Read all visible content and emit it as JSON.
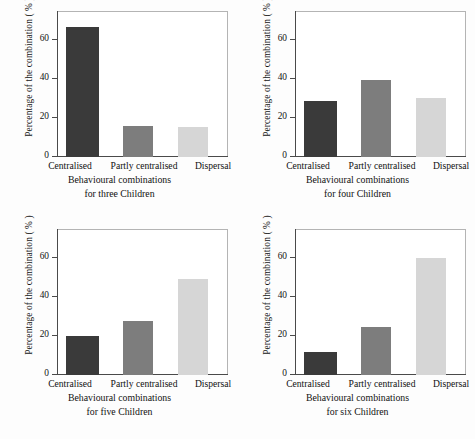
{
  "figure": {
    "background": "#ffffff"
  },
  "palette": {
    "centralised": "#3a3a3a",
    "partly_centralised": "#7d7d7d",
    "dispersal": "#d6d6d6",
    "axis": "#4a4a4a",
    "frame": "#9a9a9a",
    "text": "#111111"
  },
  "common": {
    "ylabel": "Percentage of the combination ( % )",
    "xlabel_line1": "Behavioural combinations",
    "categories": [
      "Centralised",
      "Partly centralised",
      "Dispersal"
    ],
    "yticks": [
      "0",
      "20",
      "40",
      "60"
    ],
    "ytick_values": [
      0,
      20,
      40,
      60
    ],
    "ylim": [
      0,
      75
    ]
  },
  "panels": [
    {
      "id": "panel-three-children",
      "position": "top-left",
      "xlabel_line2": "for three Children",
      "ticklabels": {
        "t0": "0",
        "t20": "20",
        "t40": "40",
        "t60": "60"
      },
      "cats": {
        "c0": "Centralised",
        "c1": "Partly centralised",
        "c2": "Dispersal"
      },
      "ylabel": "Percentage of the combination ( % )",
      "xlabel_line1": "Behavioural combinations"
    },
    {
      "id": "panel-four-children",
      "position": "top-right",
      "xlabel_line2": "for four Children",
      "ticklabels": {
        "t0": "0",
        "t20": "20",
        "t40": "40",
        "t60": "60"
      },
      "cats": {
        "c0": "Centralised",
        "c1": "Partly centralised",
        "c2": "Dispersal"
      },
      "ylabel": "Percentage of the combination ( % )",
      "xlabel_line1": "Behavioural combinations"
    },
    {
      "id": "panel-five-children",
      "position": "bottom-left",
      "xlabel_line2": "for five Children",
      "ticklabels": {
        "t0": "0",
        "t20": "20",
        "t40": "40",
        "t60": "60"
      },
      "cats": {
        "c0": "Centralised",
        "c1": "Partly centralised",
        "c2": "Dispersal"
      },
      "ylabel": "Percentage of the combination ( % )",
      "xlabel_line1": "Behavioural combinations"
    },
    {
      "id": "panel-six-children",
      "position": "bottom-right",
      "xlabel_line2": "for six Children",
      "ticklabels": {
        "t0": "0",
        "t20": "20",
        "t40": "40",
        "t60": "60"
      },
      "cats": {
        "c0": "Centralised",
        "c1": "Partly centralised",
        "c2": "Dispersal"
      },
      "ylabel": "Percentage of the combination ( % )",
      "xlabel_line1": "Behavioural combinations"
    }
  ],
  "chart_data": [
    {
      "type": "bar",
      "title": "for three Children",
      "xlabel": "Behavioural combinations for three Children",
      "ylabel": "Percentage of the combination ( % )",
      "categories": [
        "Centralised",
        "Partly centralised",
        "Dispersal"
      ],
      "values": [
        67,
        16,
        15.5
      ],
      "colors": [
        "#3a3a3a",
        "#7d7d7d",
        "#d6d6d6"
      ],
      "ylim": [
        0,
        75
      ],
      "yticks": [
        0,
        20,
        40,
        60
      ],
      "grid": false,
      "legend": "none"
    },
    {
      "type": "bar",
      "title": "for four Children",
      "xlabel": "Behavioural combinations for four Children",
      "ylabel": "Percentage of the combination ( % )",
      "categories": [
        "Centralised",
        "Partly centralised",
        "Dispersal"
      ],
      "values": [
        29,
        39.5,
        30.5
      ],
      "colors": [
        "#3a3a3a",
        "#7d7d7d",
        "#d6d6d6"
      ],
      "ylim": [
        0,
        75
      ],
      "yticks": [
        0,
        20,
        40,
        60
      ],
      "grid": false,
      "legend": "none"
    },
    {
      "type": "bar",
      "title": "for five Children",
      "xlabel": "Behavioural combinations for five Children",
      "ylabel": "Percentage of the combination ( % )",
      "categories": [
        "Centralised",
        "Partly centralised",
        "Dispersal"
      ],
      "values": [
        20,
        28,
        49.5
      ],
      "colors": [
        "#3a3a3a",
        "#7d7d7d",
        "#d6d6d6"
      ],
      "ylim": [
        0,
        75
      ],
      "yticks": [
        0,
        20,
        40,
        60
      ],
      "grid": false,
      "legend": "none"
    },
    {
      "type": "bar",
      "title": "for six Children",
      "xlabel": "Behavioural combinations for six Children",
      "ylabel": "Percentage of the combination ( % )",
      "categories": [
        "Centralised",
        "Partly centralised",
        "Dispersal"
      ],
      "values": [
        12,
        24.5,
        60
      ],
      "colors": [
        "#3a3a3a",
        "#7d7d7d",
        "#d6d6d6"
      ],
      "ylim": [
        0,
        75
      ],
      "yticks": [
        0,
        20,
        40,
        60
      ],
      "grid": false,
      "legend": "none"
    }
  ]
}
